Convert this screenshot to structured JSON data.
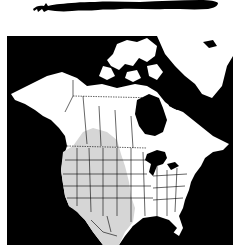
{
  "figure": {
    "type": "species range map",
    "silhouette": "lizard-silhouette",
    "map_region": "North America",
    "colors": {
      "background": "#ffffff",
      "ocean": "#000000",
      "land": "#ffffff",
      "range": "#d6d6d6",
      "borders": "#000000"
    },
    "legend": {
      "range_label": "Range"
    }
  }
}
